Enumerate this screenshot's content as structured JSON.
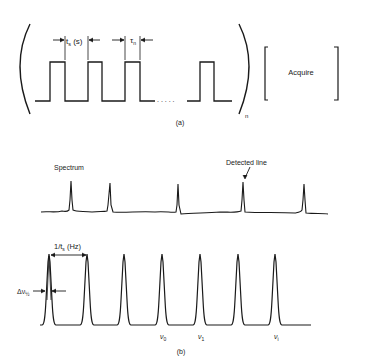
{
  "part_a": {
    "caption": "(a)",
    "label_ts": "t",
    "label_ts_sub": "s",
    "label_ts_suffix": " (s)",
    "label_tau": "τ",
    "label_tau_sub": "n",
    "repeat_subscript": "n",
    "ellipsis": ". . . . .",
    "acquire_label": "Acquire"
  },
  "part_b": {
    "caption": "(b)",
    "spectrum_label": "Spectrum",
    "detected_line_label": "Detected line",
    "spacing_label_prefix": "1/t",
    "spacing_label_sub": "s",
    "spacing_label_suffix": " (Hz)",
    "width_label": "Δν",
    "width_label_sub": "½",
    "freq_labels": [
      {
        "main": "ν",
        "sub": "0"
      },
      {
        "main": "ν",
        "sub": "1"
      },
      {
        "main": "ν",
        "sub": "i"
      }
    ]
  },
  "colors": {
    "stroke": "#1a1a1a",
    "background": "#ffffff"
  }
}
